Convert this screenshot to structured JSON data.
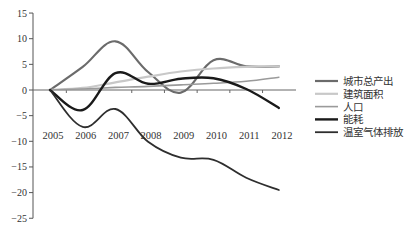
{
  "chart_data": {
    "type": "line",
    "title": "",
    "xlabel": "",
    "ylabel": "",
    "categories": [
      "2005",
      "2006",
      "2007",
      "2008",
      "2009",
      "2010",
      "2011",
      "2012"
    ],
    "ylim": [
      -25,
      15
    ],
    "yticks": [
      15,
      10,
      5,
      0,
      -5,
      -10,
      -15,
      -20,
      -25
    ],
    "grid": false,
    "legend_position": "right",
    "smooth": true,
    "series": [
      {
        "name": "城市总产出",
        "color": "#6b6b6b",
        "width": 2.2,
        "values": [
          0,
          4.5,
          9.5,
          3.5,
          -0.5,
          5.8,
          4.6,
          4.6
        ]
      },
      {
        "name": "建筑面积",
        "color": "#c8c8c8",
        "width": 2.2,
        "values": [
          0,
          0.4,
          1.5,
          2.6,
          3.6,
          4.2,
          4.5,
          4.6
        ]
      },
      {
        "name": "人口",
        "color": "#9a9a9a",
        "width": 1.6,
        "values": [
          0,
          0.2,
          0.5,
          0.7,
          1.0,
          1.3,
          1.7,
          2.5
        ]
      },
      {
        "name": "能耗",
        "color": "#1a1a1a",
        "width": 2.4,
        "values": [
          0,
          -3.9,
          3.3,
          1.2,
          2.2,
          2.3,
          0.2,
          -3.5
        ]
      },
      {
        "name": "温室气体排放",
        "color": "#2e2e2e",
        "width": 1.8,
        "values": [
          0,
          -7.2,
          -3.7,
          -10.1,
          -13.2,
          -13.6,
          -17.1,
          -19.5
        ]
      }
    ]
  }
}
